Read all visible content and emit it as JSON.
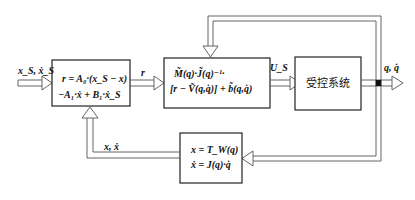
{
  "diagram": {
    "inputs": {
      "left_input": "x_S, ẋ_S"
    },
    "blocks": {
      "controller": {
        "line1": "r = A₀·(x_S − x)",
        "line2": "−A₁·ẋ + B₁·ẋ_S"
      },
      "dynamics": {
        "line1": "M̃(q)·J̃(q)⁻¹·",
        "line2": "[r − Ṽ(q,q̇)] + b̃(q,q̇)"
      },
      "plant": {
        "label": "受控系统"
      },
      "kinematics": {
        "line1": "x = T_W(q)",
        "line2": "ẋ = J(q)·q̇"
      }
    },
    "signals": {
      "r": "r",
      "us": "U_S",
      "output": "q, q̇",
      "feedback": "x, ẋ"
    }
  }
}
